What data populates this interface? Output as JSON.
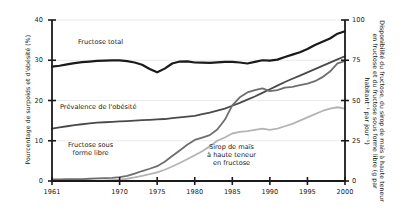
{
  "chart_data": {
    "type": "line",
    "title": "",
    "xlabel": "",
    "ylabel": "Pourcentage de surpoids et d'obésité (%)",
    "y2label": "Disponibilité du fructose, du sirop de maïs à haute teneur en fructose et du fructose sous forme libre (g par habitant⁻¹ par jour⁻¹)",
    "xlim": [
      1961,
      2000
    ],
    "ylim": [
      0,
      40
    ],
    "y2lim": [
      0,
      100
    ],
    "grid": true,
    "grid_axis": "y",
    "legend_position": "inline-annotations",
    "xticks": [
      1961,
      1970,
      1975,
      1980,
      1985,
      1990,
      1995,
      2000
    ],
    "xtick_labels": [
      "1961",
      "1970",
      "1975",
      "1980",
      "1985",
      "1990",
      "1995",
      "2000"
    ],
    "yticks_left": [
      0,
      10,
      20,
      30,
      40
    ],
    "ytick_labels_left": [
      "0",
      "10",
      "20",
      "30",
      "40"
    ],
    "yticks_right": [
      0,
      25,
      50,
      75,
      100
    ],
    "ytick_labels_right": [
      "0",
      "25",
      "50",
      "75",
      "100"
    ],
    "x": [
      1961,
      1962,
      1963,
      1964,
      1965,
      1966,
      1967,
      1968,
      1969,
      1970,
      1971,
      1972,
      1973,
      1974,
      1975,
      1976,
      1977,
      1978,
      1979,
      1980,
      1981,
      1982,
      1983,
      1984,
      1985,
      1986,
      1987,
      1988,
      1989,
      1990,
      1991,
      1992,
      1993,
      1994,
      1995,
      1996,
      1997,
      1998,
      1999,
      2000
    ],
    "series": [
      {
        "name": "Fructose total",
        "axis": "right",
        "units": "g par habitant par jour",
        "color": "#1a1a1a",
        "width": 2.2,
        "values": [
          71.0,
          71.6,
          72.4,
          73.2,
          73.8,
          74.2,
          74.6,
          74.8,
          74.9,
          74.9,
          74.5,
          73.6,
          72.2,
          69.6,
          67.5,
          69.8,
          73.0,
          74.2,
          74.3,
          73.6,
          73.5,
          73.4,
          73.7,
          74.0,
          74.0,
          73.6,
          73.0,
          74.0,
          75.0,
          74.8,
          75.4,
          77.0,
          78.5,
          80.0,
          82.0,
          84.5,
          86.5,
          88.5,
          91.5,
          93.0
        ]
      },
      {
        "name": "Prévalence de l'obésité",
        "axis": "left",
        "units": "%",
        "color": "#4a4a4a",
        "width": 1.8,
        "values": [
          13.0,
          13.3,
          13.6,
          13.9,
          14.1,
          14.3,
          14.5,
          14.6,
          14.7,
          14.8,
          14.9,
          15.0,
          15.1,
          15.2,
          15.3,
          15.4,
          15.6,
          15.8,
          16.0,
          16.2,
          16.6,
          17.0,
          17.5,
          18.0,
          18.7,
          19.4,
          20.2,
          21.0,
          21.9,
          22.8,
          23.7,
          24.6,
          25.4,
          26.2,
          27.0,
          27.8,
          28.6,
          29.4,
          30.2,
          31.0
        ]
      },
      {
        "name": "Fructose sous forme libre",
        "axis": "right",
        "units": "g par habitant par jour",
        "color": "#6e6e6e",
        "width": 1.8,
        "values": [
          1.0,
          1.0,
          1.1,
          1.1,
          1.2,
          1.4,
          1.6,
          1.8,
          2.0,
          2.4,
          3.2,
          4.6,
          6.2,
          7.6,
          9.2,
          12.0,
          15.5,
          19.0,
          22.5,
          25.5,
          27.0,
          28.5,
          32.0,
          38.0,
          47.0,
          52.0,
          55.0,
          56.5,
          57.5,
          55.8,
          56.5,
          58.0,
          58.5,
          59.5,
          60.5,
          62.0,
          64.5,
          68.0,
          73.0,
          74.5
        ]
      },
      {
        "name": "Sirop de maïs à haute teneur en fructose",
        "axis": "right",
        "units": "g par habitant par jour",
        "color": "#b4b4b4",
        "width": 1.8,
        "values": [
          0.0,
          0.0,
          0.0,
          0.0,
          0.1,
          0.1,
          0.2,
          0.3,
          0.5,
          0.8,
          1.4,
          2.2,
          3.2,
          4.2,
          5.4,
          7.0,
          9.0,
          11.2,
          13.5,
          16.0,
          18.5,
          21.5,
          25.0,
          27.0,
          29.5,
          30.5,
          31.0,
          31.8,
          32.5,
          31.8,
          32.5,
          34.0,
          35.5,
          37.5,
          39.5,
          41.5,
          43.5,
          45.0,
          45.8,
          45.0
        ]
      }
    ],
    "annotations": [
      {
        "key": "fructose_total",
        "text": "Fructose total"
      },
      {
        "key": "obesity",
        "text": "Prévalence de l'obésité"
      },
      {
        "key": "free_fructose",
        "text": "Fructose sous\nforme libre"
      },
      {
        "key": "hfcs",
        "text": "Sirop de maïs\nà haute teneur\nen fructose"
      }
    ],
    "colors": {
      "fructose_total": "#1a1a1a",
      "obesity": "#4a4a4a",
      "free_fructose": "#6e6e6e",
      "hfcs": "#b4b4b4",
      "axis": "#1a1a1a",
      "grid": "#e6e6e6",
      "background": "#ffffff"
    }
  }
}
